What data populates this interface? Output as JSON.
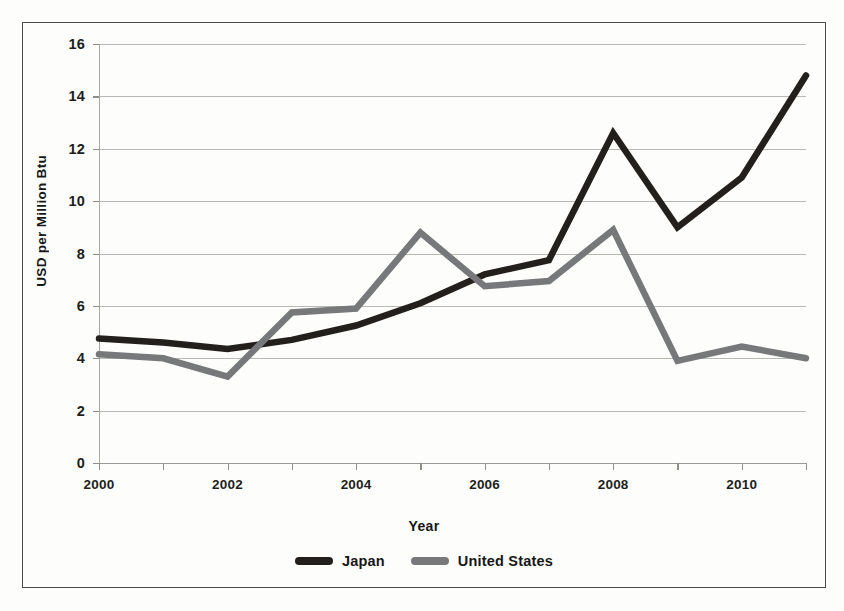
{
  "chart_data": {
    "type": "line",
    "title": "",
    "xlabel": "Year",
    "ylabel": "USD per Million Btu",
    "x": [
      2000,
      2001,
      2002,
      2003,
      2004,
      2005,
      2006,
      2007,
      2008,
      2009,
      2010,
      2011
    ],
    "xlim": [
      2000,
      2011
    ],
    "ylim": [
      0,
      16
    ],
    "ytick_labels": [
      "0",
      "2",
      "4",
      "6",
      "8",
      "10",
      "12",
      "14",
      "16"
    ],
    "ytick_values": [
      0,
      2,
      4,
      6,
      8,
      10,
      12,
      14,
      16
    ],
    "xtick_labels": [
      "2000",
      "2002",
      "2004",
      "2006",
      "2008",
      "2010"
    ],
    "xtick_values": [
      2000,
      2002,
      2004,
      2006,
      2008,
      2010
    ],
    "grid": true,
    "legend_position": "bottom",
    "series": [
      {
        "name": "Japan",
        "color": "#231f1c",
        "values": [
          4.75,
          4.6,
          4.35,
          4.7,
          5.25,
          6.1,
          7.2,
          7.75,
          12.6,
          9.0,
          10.9,
          14.8
        ]
      },
      {
        "name": "United States",
        "color": "#77787a",
        "values": [
          4.15,
          4.0,
          3.3,
          5.75,
          5.9,
          8.8,
          6.75,
          6.95,
          8.9,
          3.9,
          4.45,
          4.0
        ]
      }
    ]
  },
  "axes": {
    "y_title": "USD per Million Btu",
    "x_title": "Year"
  },
  "legend": {
    "entries": [
      {
        "label": "Japan",
        "color": "#231f1c"
      },
      {
        "label": "United States",
        "color": "#77787a"
      }
    ]
  }
}
